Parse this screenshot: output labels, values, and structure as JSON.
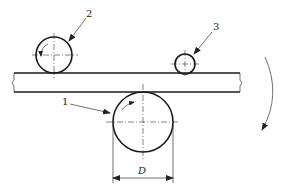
{
  "diagram": {
    "type": "mechanical-schematic",
    "labels": {
      "roller_1": "1",
      "roller_2": "2",
      "roller_3": "3",
      "dimension": "D"
    },
    "elements": [
      {
        "id": "strip",
        "kind": "strip/plate",
        "note": "horizontal strip with break line at right end"
      },
      {
        "id": "roller_1",
        "kind": "large roller",
        "position": "below strip",
        "dimension_label": "D"
      },
      {
        "id": "roller_2",
        "kind": "roller",
        "position": "above strip, left"
      },
      {
        "id": "roller_3",
        "kind": "small roller",
        "position": "above strip, right"
      },
      {
        "id": "rotation_arrow",
        "kind": "curved arrow",
        "direction": "clockwise/downward",
        "position": "right side"
      }
    ]
  }
}
